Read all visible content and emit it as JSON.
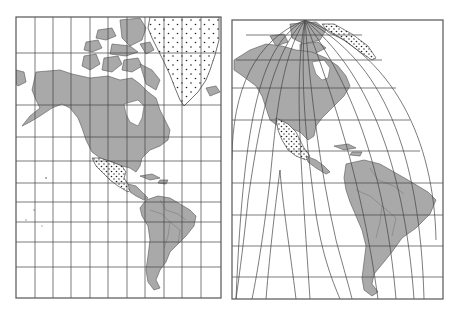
{
  "colors": {
    "background": "#ffffff",
    "land": "#a9a9a9",
    "grid": "#444444",
    "frame": "#555555",
    "dots": "#222222"
  },
  "maps": [
    {
      "id": "left-map",
      "projection": "rectangular (cylindrical) grid",
      "frame": {
        "x": 16,
        "y": 17,
        "width": 205,
        "height": 281
      },
      "meridians_x": [
        35,
        53,
        71,
        90,
        108,
        127,
        145,
        164,
        182,
        201
      ],
      "parallels_y": [
        53,
        105,
        137,
        161,
        183,
        202,
        222,
        242,
        267
      ],
      "regions": [
        "north-america",
        "south-america",
        "greenland-dotted",
        "mexico-dotted",
        "arctic-islands",
        "caribbean"
      ]
    },
    {
      "id": "right-map",
      "projection": "curved meridian projection converging at pole, interrupted in south Pacific",
      "frame": {
        "x": 232,
        "y": 20,
        "width": 211,
        "height": 279
      },
      "pole": {
        "x": 305,
        "y": 20
      },
      "parallels_y": [
        35,
        60,
        88,
        120,
        151,
        183,
        215,
        246,
        277
      ],
      "regions": [
        "north-america",
        "south-america",
        "greenland-dotted-edge",
        "mexico-dotted",
        "caribbean"
      ]
    }
  ]
}
